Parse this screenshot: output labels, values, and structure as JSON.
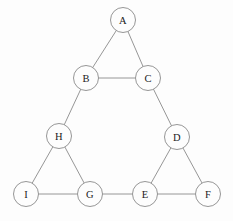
{
  "canvas": {
    "width": 233,
    "height": 221,
    "background_color": "#fdfdfd",
    "stroke_color": "#8a8a8a",
    "label_color": "#1a1a1a",
    "node_fill": "#fdfdfd",
    "node_radius": 12.5,
    "stroke_width": 0.9
  },
  "chart_data": {
    "type": "diagram",
    "diagram_kind": "undirected-graph",
    "title": "",
    "node_count": 9,
    "edge_count": 12,
    "nodes": [
      {
        "id": "A",
        "label": "A",
        "x": 123,
        "y": 20
      },
      {
        "id": "B",
        "label": "B",
        "x": 86,
        "y": 78
      },
      {
        "id": "C",
        "label": "C",
        "x": 148,
        "y": 78
      },
      {
        "id": "H",
        "label": "H",
        "x": 59,
        "y": 136
      },
      {
        "id": "D",
        "label": "D",
        "x": 177,
        "y": 137
      },
      {
        "id": "I",
        "label": "I",
        "x": 26,
        "y": 194
      },
      {
        "id": "G",
        "label": "G",
        "x": 90,
        "y": 194
      },
      {
        "id": "E",
        "label": "E",
        "x": 145,
        "y": 194
      },
      {
        "id": "F",
        "label": "F",
        "x": 208,
        "y": 194
      }
    ],
    "edges": [
      {
        "source": "A",
        "target": "B"
      },
      {
        "source": "A",
        "target": "C"
      },
      {
        "source": "B",
        "target": "C"
      },
      {
        "source": "B",
        "target": "H"
      },
      {
        "source": "C",
        "target": "D"
      },
      {
        "source": "H",
        "target": "I"
      },
      {
        "source": "H",
        "target": "G"
      },
      {
        "source": "I",
        "target": "G"
      },
      {
        "source": "G",
        "target": "E"
      },
      {
        "source": "D",
        "target": "E"
      },
      {
        "source": "D",
        "target": "F"
      },
      {
        "source": "E",
        "target": "F"
      }
    ]
  }
}
